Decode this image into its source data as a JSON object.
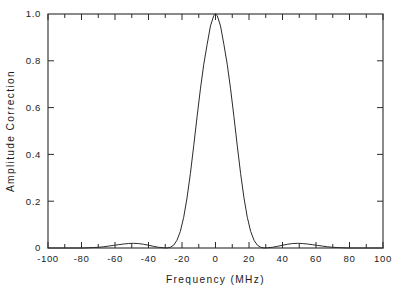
{
  "chart_data": {
    "type": "line",
    "title": "",
    "xlabel": "Frequency (MHz)",
    "ylabel": "Amplitude Correction",
    "xlim": [
      -100,
      100
    ],
    "ylim": [
      0,
      1.0
    ],
    "grid": false,
    "legend": null,
    "x_ticks_major": [
      -100,
      -80,
      -60,
      -40,
      -20,
      0,
      20,
      40,
      60,
      80,
      100
    ],
    "x_tick_labels": [
      "-100",
      "-80",
      "-60",
      "-40",
      "-20",
      "0",
      "20",
      "40",
      "60",
      "80",
      "100"
    ],
    "x_ticks_minor": [
      -90,
      -70,
      -50,
      -30,
      -10,
      10,
      30,
      50,
      70,
      90
    ],
    "y_ticks_major": [
      0,
      0.2,
      0.4,
      0.6,
      0.8,
      1.0
    ],
    "y_tick_labels": [
      "0",
      "0.2",
      "0.4",
      "0.6",
      "0.8",
      "1.0"
    ],
    "series": [
      {
        "name": "Amplitude Correction",
        "x": [
          -100,
          -97,
          -94,
          -91,
          -88,
          -85,
          -82,
          -79,
          -76,
          -73,
          -70,
          -67,
          -64,
          -61,
          -58,
          -55,
          -52,
          -49,
          -46,
          -43,
          -40,
          -37,
          -34,
          -31,
          -29,
          -27,
          -25,
          -23,
          -21,
          -19,
          -17,
          -15,
          -13,
          -11,
          -9,
          -7,
          -5,
          -3,
          -1,
          0,
          1,
          3,
          5,
          7,
          9,
          11,
          13,
          15,
          17,
          19,
          21,
          23,
          25,
          27,
          29,
          31,
          34,
          37,
          40,
          43,
          46,
          49,
          52,
          55,
          58,
          61,
          64,
          67,
          70,
          73,
          76,
          79,
          82,
          85,
          88,
          91,
          94,
          97,
          100
        ],
        "y": [
          0.0,
          0.0,
          0.0,
          0.0,
          0.0,
          0.0,
          0.0,
          0.0,
          0.001,
          0.002,
          0.003,
          0.005,
          0.008,
          0.011,
          0.014,
          0.017,
          0.019,
          0.02,
          0.019,
          0.016,
          0.012,
          0.007,
          0.003,
          0.001,
          0.0,
          0.003,
          0.012,
          0.033,
          0.071,
          0.131,
          0.214,
          0.318,
          0.437,
          0.561,
          0.68,
          0.785,
          0.87,
          0.949,
          0.994,
          1.0,
          0.994,
          0.949,
          0.87,
          0.785,
          0.68,
          0.561,
          0.437,
          0.318,
          0.214,
          0.131,
          0.071,
          0.033,
          0.012,
          0.003,
          0.0,
          0.001,
          0.003,
          0.007,
          0.012,
          0.016,
          0.019,
          0.02,
          0.019,
          0.017,
          0.014,
          0.011,
          0.008,
          0.005,
          0.003,
          0.002,
          0.001,
          0.0,
          0.0,
          0.0,
          0.0,
          0.0,
          0.0,
          0.0,
          0.0
        ],
        "peak_value": 1.0,
        "peak_x": 0,
        "fwhm": 31,
        "first_null_x": [
          -30,
          30
        ],
        "sidelobe_peak_value": 0.02,
        "sidelobe_peak_x": [
          -49,
          49
        ],
        "color": "#2b2b2b"
      }
    ]
  }
}
